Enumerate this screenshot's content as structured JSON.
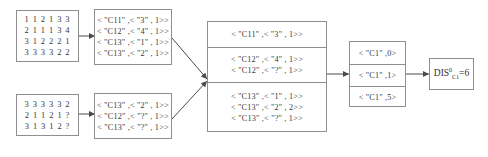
{
  "diagram": {
    "table_top": {
      "rows": [
        "1 1 2 1 3 3",
        "2 1 1 1 3 4",
        "3 1 2 2 2 1",
        "3 3 3 3 2 2"
      ]
    },
    "table_bottom": {
      "rows": [
        "3 3 3 3 3 2",
        "2 1 1 2 1 ?",
        "3 1 3 1 2 ?"
      ]
    },
    "mapper_top": {
      "rows": [
        "< \"C11\" ,< \"3\" , 1>>",
        "< \"C12\" ,< \"4\" , 1>>",
        "< \"C13\" ,< \"1\" , 1>>",
        "< \"C13\" ,< \"2\" , 1>>"
      ]
    },
    "mapper_bottom": {
      "rows": [
        "< \"C13\" ,< \"2\" , 1>>",
        "< \"C12\" ,< \"?\" , 1>>",
        "< \"C13\" ,< \"?\" , 1>>"
      ]
    },
    "combiner": {
      "groups": [
        {
          "rows": [
            "< \"C11\" ,< \"3\" , 1>>"
          ]
        },
        {
          "rows": [
            "< \"C12\" ,< \"4\" , 1>>",
            "< \"C12\" ,< \"?\" , 1>>"
          ]
        },
        {
          "rows": [
            "< \"C13\" ,< \"1\" , 1>>",
            "< \"C13\" ,< \"2\" , 2>>",
            "< \"C13\" ,< \"?\" , 1>>"
          ]
        }
      ]
    },
    "reducer": {
      "cells": [
        "< \"C1\" ,0>",
        "< \"C1\" ,1>",
        "< \"C1\" ,5>"
      ]
    },
    "result": {
      "prefix": "DIS",
      "superscript": "0",
      "subscript": "C1",
      "equals": "=6"
    },
    "colors": {
      "border": "#8f8f8f",
      "text": "#3a3a3a",
      "arrow": "#4a4a4a",
      "background": "#ffffff"
    }
  }
}
